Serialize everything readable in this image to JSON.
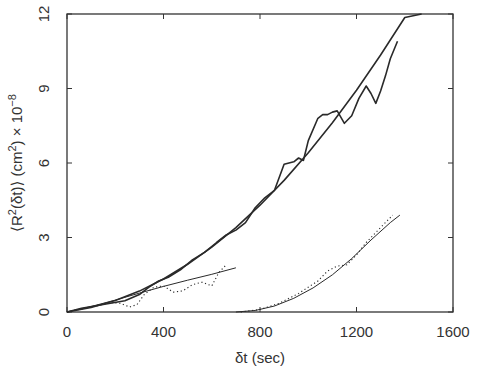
{
  "chart_data": {
    "type": "line",
    "title": "",
    "xlabel": "δt (sec)",
    "ylabel": "⟨R²(δt)⟩ (cm²) × 10⁻⁸",
    "xlim": [
      0,
      1600
    ],
    "ylim": [
      0,
      12
    ],
    "xticks": [
      0,
      400,
      800,
      1200,
      1600
    ],
    "yticks": [
      0,
      3,
      6,
      9,
      12
    ],
    "grid": false,
    "legend": null,
    "series": [
      {
        "name": "data-1 (solid jagged)",
        "style": "solid",
        "x": [
          0,
          60,
          120,
          180,
          240,
          300,
          340,
          380,
          420,
          470,
          520,
          570,
          620,
          660,
          700,
          740,
          780,
          820,
          860,
          900,
          940,
          960,
          980,
          1000,
          1040,
          1060,
          1080,
          1100,
          1120,
          1150,
          1180,
          1210,
          1240,
          1260,
          1280,
          1300,
          1320,
          1340,
          1370
        ],
        "y": [
          0,
          0.15,
          0.25,
          0.35,
          0.45,
          0.7,
          1.0,
          1.25,
          1.4,
          1.7,
          2.1,
          2.4,
          2.8,
          3.1,
          3.3,
          3.6,
          4.2,
          4.6,
          4.9,
          5.95,
          6.05,
          6.2,
          6.1,
          6.9,
          7.8,
          7.95,
          7.95,
          8.05,
          8.1,
          7.6,
          7.9,
          8.6,
          9.1,
          8.8,
          8.4,
          8.9,
          9.5,
          10.2,
          10.9
        ]
      },
      {
        "name": "fit-1 (solid smooth)",
        "style": "solid",
        "x": [
          0,
          100,
          200,
          300,
          400,
          500,
          600,
          700,
          800,
          900,
          1000,
          1100,
          1200,
          1300,
          1400,
          1470
        ],
        "y": [
          0,
          0.18,
          0.46,
          0.84,
          1.33,
          1.92,
          2.61,
          3.4,
          4.3,
          5.3,
          6.41,
          7.62,
          8.93,
          10.35,
          11.86,
          12.0
        ]
      },
      {
        "name": "data-2 (dotted, early)",
        "style": "dotted",
        "x": [
          0,
          60,
          120,
          180,
          220,
          260,
          290,
          320,
          360,
          400,
          440,
          480,
          520,
          560,
          600,
          630,
          660
        ],
        "y": [
          0,
          0.12,
          0.25,
          0.38,
          0.35,
          0.2,
          0.3,
          0.7,
          1.0,
          1.05,
          0.8,
          0.85,
          1.1,
          1.2,
          1.05,
          1.6,
          1.9
        ]
      },
      {
        "name": "fit-2 (thin solid line)",
        "style": "solid-thin",
        "x": [
          0,
          100,
          200,
          300,
          400,
          500,
          600,
          700
        ],
        "y": [
          0,
          0.22,
          0.48,
          0.76,
          1.03,
          1.28,
          1.52,
          1.78
        ]
      },
      {
        "name": "data-3 (dotted, late)",
        "style": "dotted",
        "x": [
          720,
          800,
          880,
          960,
          1040,
          1080,
          1120,
          1160,
          1200,
          1240,
          1280,
          1320,
          1350
        ],
        "y": [
          0,
          0.1,
          0.35,
          0.75,
          1.25,
          1.65,
          1.85,
          1.9,
          2.3,
          2.8,
          3.2,
          3.6,
          3.9
        ]
      },
      {
        "name": "fit-3 (thin solid curve)",
        "style": "solid-thin",
        "x": [
          700,
          780,
          860,
          940,
          1020,
          1100,
          1180,
          1260,
          1340,
          1380
        ],
        "y": [
          0,
          0.06,
          0.24,
          0.55,
          0.97,
          1.5,
          2.15,
          2.9,
          3.6,
          3.9
        ]
      }
    ]
  },
  "axes": {
    "x_tick_labels": [
      "0",
      "400",
      "800",
      "1200",
      "1600"
    ],
    "y_tick_labels": [
      "0",
      "3",
      "6",
      "9",
      "12"
    ],
    "x_title": "δt  (sec)",
    "y_title_parts": {
      "pre": "⟨R",
      "sup1": "2",
      "mid": "(δt)⟩  (cm",
      "sup2": "2",
      "post": ")  × 10",
      "sup3": "−8"
    }
  },
  "colors": {
    "line": "#2a2a2a",
    "axis": "#333333",
    "background": "#ffffff"
  }
}
